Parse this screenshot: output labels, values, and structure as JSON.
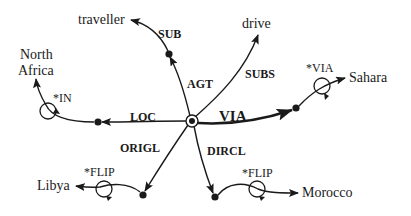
{
  "diagram": {
    "type": "semantic-network",
    "center": {
      "name": "hub",
      "style": "double-circle"
    },
    "nodes": {
      "traveller": "traveller",
      "drive": "drive",
      "north_africa_line1": "North",
      "north_africa_line2": "Africa",
      "sahara": "Sahara",
      "libya": "Libya",
      "morocco": "Morocco"
    },
    "relations": {
      "sub": "SUB",
      "agt": "AGT",
      "subs": "SUBS",
      "loc": "LOC",
      "via": "VIA",
      "origl": "ORIGL",
      "dircl": "DIRCL"
    },
    "markers": {
      "in": "*IN",
      "via": "*VIA",
      "flip_libya": "*FLIP",
      "flip_morocco": "*FLIP"
    },
    "edges": [
      {
        "from": "hub",
        "relation": "AGT",
        "to": "intermediate-agt"
      },
      {
        "from": "intermediate-agt",
        "relation": "SUB",
        "to": "traveller"
      },
      {
        "from": "hub",
        "relation": "SUBS",
        "to": "drive"
      },
      {
        "from": "hub",
        "relation": "LOC",
        "to": "intermediate-loc"
      },
      {
        "from": "intermediate-loc",
        "relation": "*IN",
        "to": "North Africa"
      },
      {
        "from": "hub",
        "relation": "VIA",
        "to": "intermediate-via",
        "emphasis": "thick"
      },
      {
        "from": "intermediate-via",
        "relation": "*VIA",
        "to": "Sahara"
      },
      {
        "from": "hub",
        "relation": "ORIGL",
        "to": "intermediate-origl"
      },
      {
        "from": "intermediate-origl",
        "relation": "*FLIP",
        "to": "Libya"
      },
      {
        "from": "hub",
        "relation": "DIRCL",
        "to": "intermediate-dircl"
      },
      {
        "from": "intermediate-dircl",
        "relation": "*FLIP",
        "to": "Morocco"
      }
    ],
    "colors": {
      "ink": "#1a1a1a",
      "background": "#ffffff"
    }
  }
}
